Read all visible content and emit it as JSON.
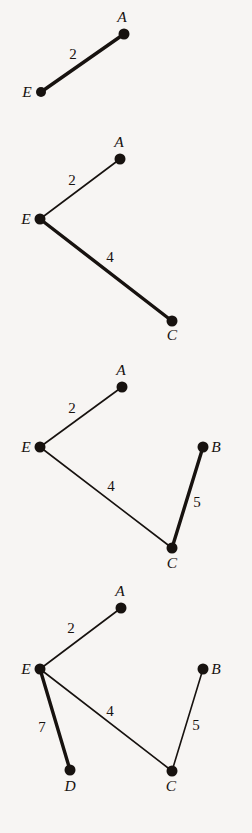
{
  "figure": {
    "background_color": "#f7f5f3",
    "ink_color": "#17120f",
    "panel_count": 4,
    "panels": [
      {
        "id": "panel-1",
        "y_offset": 0,
        "height": 120,
        "nodes": [
          {
            "id": "E",
            "label": "E",
            "x": 41,
            "y": 92,
            "r": 5,
            "label_x": 27,
            "label_y": 97
          },
          {
            "id": "A",
            "label": "A",
            "x": 124,
            "y": 34,
            "r": 5.5,
            "label_x": 122,
            "label_y": 22
          }
        ],
        "edges": [
          {
            "from": "E",
            "to": "A",
            "weight": "2",
            "style": "thick",
            "label_x": 73,
            "label_y": 59
          }
        ]
      },
      {
        "id": "panel-2",
        "y_offset": 120,
        "height": 240,
        "nodes": [
          {
            "id": "E",
            "label": "E",
            "x": 40,
            "y": 99,
            "r": 5.5,
            "label_x": 26,
            "label_y": 104
          },
          {
            "id": "A",
            "label": "A",
            "x": 120,
            "y": 39,
            "r": 5.5,
            "label_x": 119,
            "label_y": 27
          },
          {
            "id": "C",
            "label": "C",
            "x": 172,
            "y": 201,
            "r": 5.5,
            "label_x": 172,
            "label_y": 220
          }
        ],
        "edges": [
          {
            "from": "E",
            "to": "A",
            "weight": "2",
            "style": "thin",
            "label_x": 72,
            "label_y": 65
          },
          {
            "from": "E",
            "to": "C",
            "weight": "4",
            "style": "thick",
            "label_x": 110,
            "label_y": 142
          }
        ]
      },
      {
        "id": "panel-3",
        "y_offset": 360,
        "height": 215,
        "nodes": [
          {
            "id": "E",
            "label": "E",
            "x": 40,
            "y": 87,
            "r": 5.5,
            "label_x": 26,
            "label_y": 92
          },
          {
            "id": "A",
            "label": "A",
            "x": 122,
            "y": 27,
            "r": 5.5,
            "label_x": 121,
            "label_y": 15
          },
          {
            "id": "C",
            "label": "C",
            "x": 172,
            "y": 188,
            "r": 5.5,
            "label_x": 172,
            "label_y": 208
          },
          {
            "id": "B",
            "label": "B",
            "x": 203,
            "y": 87,
            "r": 5.5,
            "label_x": 216,
            "label_y": 92
          }
        ],
        "edges": [
          {
            "from": "E",
            "to": "A",
            "weight": "2",
            "style": "thin",
            "label_x": 72,
            "label_y": 53
          },
          {
            "from": "E",
            "to": "C",
            "weight": "4",
            "style": "thin",
            "label_x": 111,
            "label_y": 131
          },
          {
            "from": "C",
            "to": "B",
            "weight": "5",
            "style": "thick",
            "label_x": 197,
            "label_y": 147
          }
        ]
      },
      {
        "id": "panel-4",
        "y_offset": 575,
        "height": 258,
        "nodes": [
          {
            "id": "E",
            "label": "E",
            "x": 40,
            "y": 94,
            "r": 5.5,
            "label_x": 26,
            "label_y": 99
          },
          {
            "id": "A",
            "label": "A",
            "x": 121,
            "y": 33,
            "r": 5.5,
            "label_x": 120,
            "label_y": 21
          },
          {
            "id": "C",
            "label": "C",
            "x": 172,
            "y": 196,
            "r": 5.5,
            "label_x": 171,
            "label_y": 216
          },
          {
            "id": "B",
            "label": "B",
            "x": 203,
            "y": 94,
            "r": 5.5,
            "label_x": 216,
            "label_y": 99
          },
          {
            "id": "D",
            "label": "D",
            "x": 70,
            "y": 195,
            "r": 5.5,
            "label_x": 70,
            "label_y": 216
          }
        ],
        "edges": [
          {
            "from": "E",
            "to": "A",
            "weight": "2",
            "style": "thin",
            "label_x": 71,
            "label_y": 58
          },
          {
            "from": "E",
            "to": "D",
            "weight": "7",
            "style": "thick",
            "label_x": 42,
            "label_y": 157
          },
          {
            "from": "E",
            "to": "C",
            "weight": "4",
            "style": "thin",
            "label_x": 110,
            "label_y": 141
          },
          {
            "from": "C",
            "to": "B",
            "weight": "5",
            "style": "thin",
            "label_x": 196,
            "label_y": 155
          }
        ]
      }
    ]
  }
}
